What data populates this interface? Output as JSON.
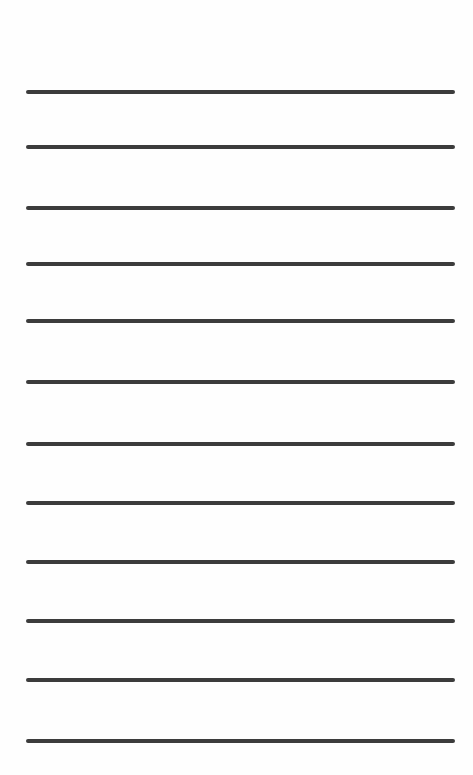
{
  "page": {
    "type": "lined-writing-page",
    "background_color": "#fefefe",
    "rule_color": "#3c3c3c",
    "rule_left": 26,
    "rule_right": 455,
    "rule_thickness": 4,
    "rules": [
      {
        "y": 90
      },
      {
        "y": 145
      },
      {
        "y": 206
      },
      {
        "y": 262
      },
      {
        "y": 319
      },
      {
        "y": 380
      },
      {
        "y": 442
      },
      {
        "y": 501
      },
      {
        "y": 560
      },
      {
        "y": 619
      },
      {
        "y": 678
      },
      {
        "y": 739
      }
    ]
  }
}
